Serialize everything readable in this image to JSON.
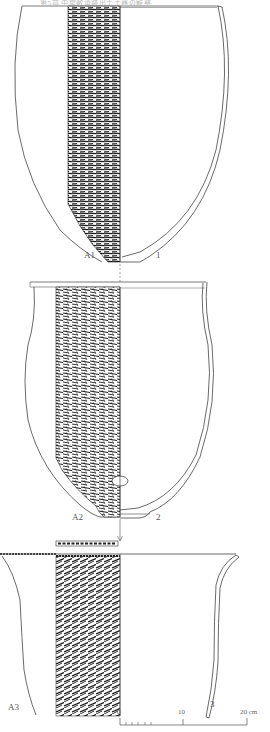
{
  "header": {
    "text": "第5章 中屋敷遺跡出土土器の観察"
  },
  "figure": {
    "vessels": [
      {
        "number": "1",
        "rubbing_label": "A1",
        "form": "deep bowl, pointed base"
      },
      {
        "number": "2",
        "rubbing_label": "A2",
        "form": "deep jar, small flat base"
      },
      {
        "number": "3",
        "rubbing_label": "A3",
        "form": "flared-rim jar (upper part)"
      }
    ],
    "labels": {
      "v1_number": "1",
      "v1_rubbing": "A1",
      "v2_number": "2",
      "v2_rubbing": "A2",
      "v3_number": "3",
      "v3_rubbing": "A3"
    },
    "scale_bar": {
      "ticks": [
        "0",
        "10",
        "20 cm"
      ],
      "tick_0": "0",
      "tick_10": "10",
      "tick_20": "20 cm",
      "unit": "cm",
      "max": 20
    },
    "colors": {
      "line": "#444444",
      "rubbing": "#222222",
      "paper": "#ffffff"
    }
  }
}
